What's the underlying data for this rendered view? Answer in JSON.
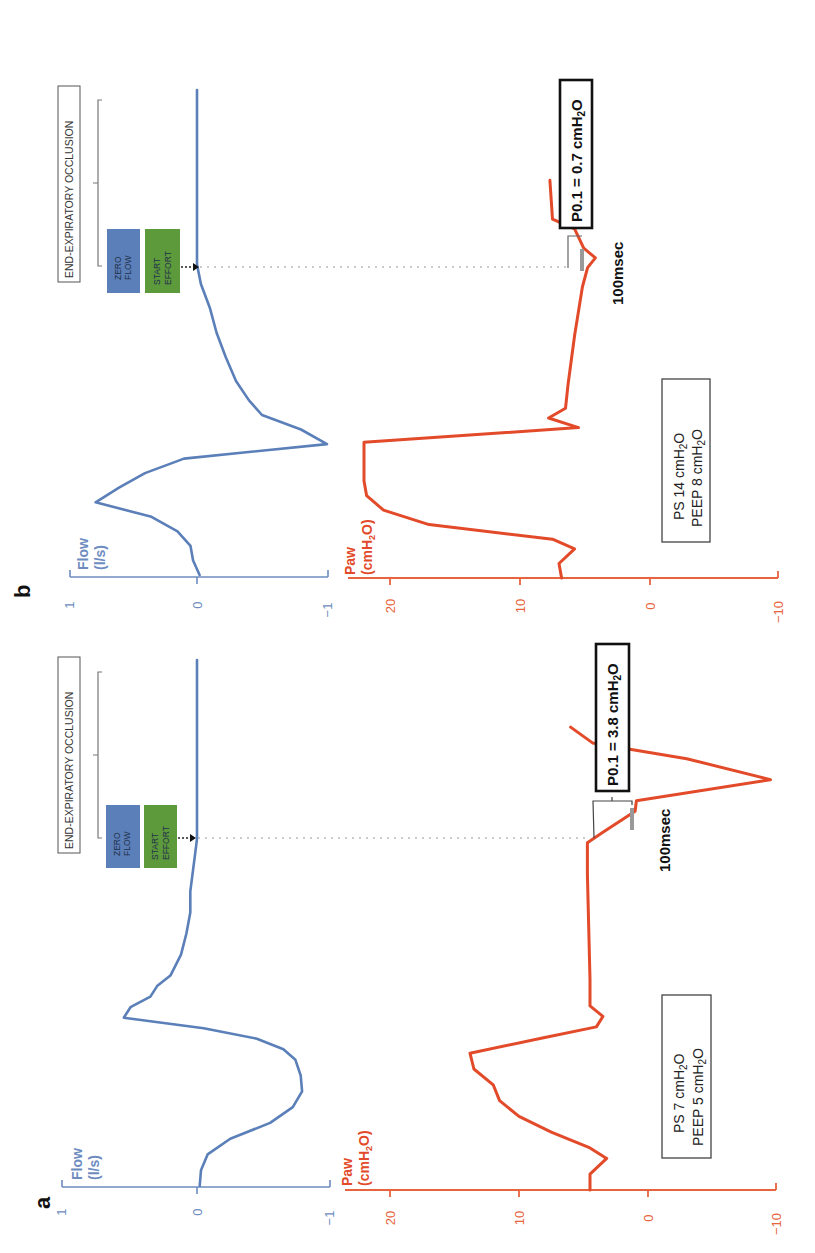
{
  "figure": {
    "orientation": "rotated 90 degrees counter-clockwise; time runs bottom-to-top, signal value runs left-to-right"
  },
  "panels": [
    {
      "id": "a",
      "letter": "a",
      "flow_label_line1": "Flow",
      "flow_label_line2": "(l/s)",
      "paw_label_line1": "Paw",
      "paw_label_line2": "(cmH2O)",
      "flow_ticks": [
        "1",
        "0",
        "−1"
      ],
      "paw_ticks": [
        "20",
        "10",
        "0",
        "−10"
      ],
      "settings_line1": "PS 7 cmH2O",
      "settings_line2": "PEEP 5 cmH2O",
      "zero_flow_label_line1": "ZERO",
      "zero_flow_label_line2": "FLOW",
      "start_effort_label_line1": "START",
      "start_effort_label_line2": "EFFORT",
      "occlusion_label": "END-EXPIRATORY OCCLUSION",
      "p01_label": "P0.1 = 3.8 cmH2O",
      "interval_label": "100msec"
    },
    {
      "id": "b",
      "letter": "b",
      "flow_label_line1": "Flow",
      "flow_label_line2": "(l/s)",
      "paw_label_line1": "Paw",
      "paw_label_line2": "(cmH2O)",
      "flow_ticks": [
        "1",
        "0",
        "−1"
      ],
      "paw_ticks": [
        "20",
        "10",
        "0",
        "−10"
      ],
      "settings_line1": "PS 14 cmH2O",
      "settings_line2": "PEEP 8 cmH2O",
      "zero_flow_label_line1": "ZERO",
      "zero_flow_label_line2": "FLOW",
      "start_effort_label_line1": "START",
      "start_effort_label_line2": "EFFORT",
      "occlusion_label": "END-EXPIRATORY OCCLUSION",
      "p01_label": "P0.1 = 0.7 cmH2O",
      "interval_label": "100msec"
    }
  ],
  "colors": {
    "flow": "#5b7fb8",
    "paw": "#e24a2a",
    "zero_flow_box": "#5b7fb8",
    "start_effort_box": "#5d9a3c"
  },
  "chart_data": [
    {
      "type": "line",
      "title": "a — PS 7 cmH2O, PEEP 5 cmH2O (P0.1 = 3.8 cmH2O)",
      "xlabel": "time (relative, arbitrary units; 100msec interval marked)",
      "series": [
        {
          "name": "Flow (l/s)",
          "ylim": [
            -1,
            1
          ],
          "t": [
            0,
            3,
            6,
            9,
            12,
            15,
            18,
            21,
            24,
            26,
            28,
            30,
            32,
            34,
            36,
            38,
            40,
            44,
            48,
            52,
            56,
            60,
            64,
            66,
            100
          ],
          "values": [
            -0.02,
            -0.03,
            -0.08,
            -0.25,
            -0.55,
            -0.72,
            -0.79,
            -0.78,
            -0.74,
            -0.65,
            -0.45,
            -0.05,
            0.55,
            0.5,
            0.35,
            0.3,
            0.2,
            0.12,
            0.08,
            0.05,
            0.05,
            0.03,
            0.01,
            0.0,
            0.0
          ]
        },
        {
          "name": "Paw (cmH2O)",
          "ylim": [
            -10,
            22
          ],
          "t": [
            0,
            3,
            6,
            8,
            11,
            14,
            17,
            20,
            23,
            26,
            29,
            31,
            33,
            35,
            40,
            50,
            60,
            66,
            68,
            72,
            74,
            78,
            82,
            85,
            88
          ],
          "values": [
            4.5,
            4.5,
            3.2,
            4.5,
            7.5,
            10,
            11.5,
            12,
            13.5,
            13.8,
            8,
            4,
            3.5,
            4.5,
            4.5,
            4.6,
            4.7,
            4.7,
            3.5,
            1,
            0.9,
            -9.5,
            -3,
            4.3,
            6
          ]
        }
      ],
      "annotations": [
        "ZERO FLOW",
        "START EFFORT",
        "END-EXPIRATORY OCCLUSION",
        "P0.1 = 3.8 cmH2O",
        "100msec",
        "PS 7 cmH2O / PEEP 5 cmH2O"
      ]
    },
    {
      "type": "line",
      "title": "b — PS 14 cmH2O, PEEP 8 cmH2O (P0.1 = 0.7 cmH2O)",
      "xlabel": "time (relative, arbitrary units; 100msec interval marked)",
      "series": [
        {
          "name": "Flow (l/s)",
          "ylim": [
            -1,
            1
          ],
          "t": [
            0,
            3,
            6,
            9,
            12,
            15,
            18,
            21,
            24,
            27,
            30,
            33,
            36,
            40,
            45,
            50,
            55,
            60,
            64,
            100
          ],
          "values": [
            -0.02,
            0.03,
            0.05,
            0.15,
            0.35,
            0.78,
            0.6,
            0.4,
            0.1,
            -1.0,
            -0.8,
            -0.5,
            -0.4,
            -0.3,
            -0.22,
            -0.15,
            -0.1,
            -0.03,
            0.0,
            0.0
          ]
        },
        {
          "name": "Paw (cmH2O)",
          "ylim": [
            -10,
            22
          ],
          "t": [
            0,
            3,
            6,
            8,
            11,
            14,
            17,
            20,
            24,
            28,
            31,
            33,
            35,
            40,
            50,
            60,
            64,
            66,
            68,
            72,
            74,
            78,
            82
          ],
          "values": [
            6.8,
            7,
            5.8,
            7.5,
            17,
            20.5,
            21.8,
            22,
            22,
            22,
            5.5,
            7.8,
            6.5,
            6.3,
            5.8,
            5.2,
            4.8,
            4.2,
            5.1,
            5.8,
            7.5,
            7.6,
            7.7
          ]
        }
      ],
      "annotations": [
        "ZERO FLOW",
        "START EFFORT",
        "END-EXPIRATORY OCCLUSION",
        "P0.1 = 0.7 cmH2O",
        "100msec",
        "PS 14 cmH2O / PEEP 8 cmH2O"
      ]
    }
  ]
}
